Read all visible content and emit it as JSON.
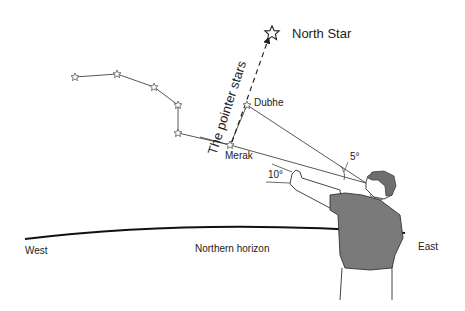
{
  "diagram": {
    "labels": {
      "north_star": "North Star",
      "pointer_stars": "The pointer stars",
      "dubhe": "Dubhe",
      "merak": "Merak",
      "angle_small": "5°",
      "angle_fist": "10°",
      "west": "West",
      "horizon": "Northern horizon",
      "east": "East"
    },
    "stars": [
      {
        "name": "star-1",
        "x": 75,
        "y": 77
      },
      {
        "name": "star-2",
        "x": 117,
        "y": 74
      },
      {
        "name": "star-3",
        "x": 154,
        "y": 87
      },
      {
        "name": "star-4",
        "x": 178,
        "y": 105
      },
      {
        "name": "star-5",
        "x": 178,
        "y": 133
      },
      {
        "name": "merak",
        "x": 230,
        "y": 145
      },
      {
        "name": "dubhe",
        "x": 247,
        "y": 105
      },
      {
        "name": "north-star",
        "x": 270,
        "y": 33
      }
    ],
    "colors": {
      "ink": "#222222",
      "shirt": "#7a7a7a",
      "hair": "#6e6e6e",
      "skin": "#ffffff"
    }
  }
}
